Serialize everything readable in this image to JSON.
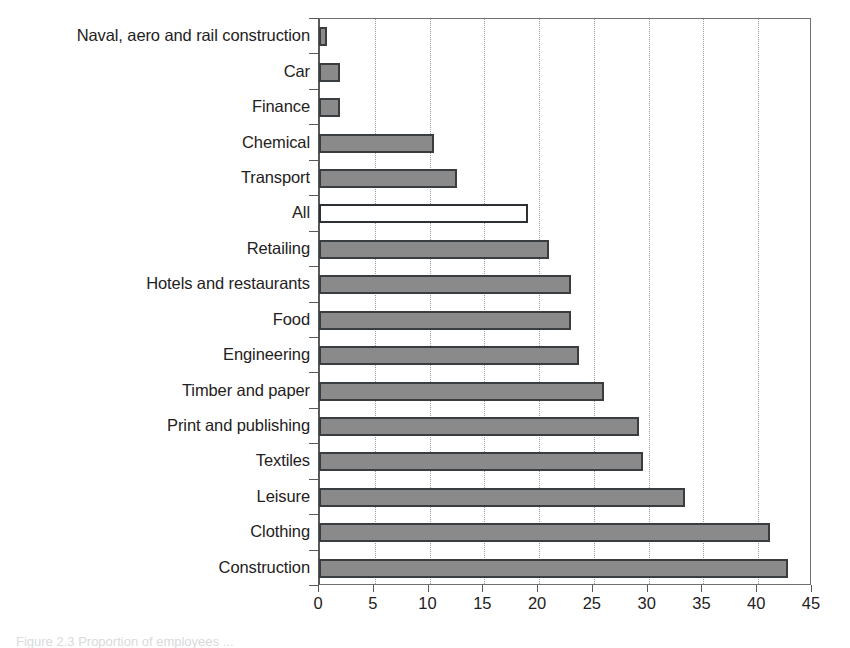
{
  "chart_data": {
    "type": "bar",
    "orientation": "horizontal",
    "title": "",
    "xlabel": "",
    "ylabel": "",
    "xlim": [
      0,
      45
    ],
    "xticks": [
      0,
      5,
      10,
      15,
      20,
      25,
      30,
      35,
      40,
      45
    ],
    "grid": "vertical-dotted",
    "legend": "none",
    "categories": [
      "Naval, aero and rail construction",
      "Car",
      "Finance",
      "Chemical",
      "Transport",
      "All",
      "Retailing",
      "Hotels and restaurants",
      "Food",
      "Engineering",
      "Timber and paper",
      "Print and publishing",
      "Textiles",
      "Leisure",
      "Clothing",
      "Construction"
    ],
    "values": [
      0.7,
      1.9,
      1.9,
      10.5,
      12.6,
      19.1,
      21.0,
      23.0,
      23.0,
      23.7,
      26.0,
      29.2,
      29.6,
      33.4,
      41.2,
      42.8
    ],
    "highlight_category": "All",
    "colors": {
      "bar_fill": "#8a8a8a",
      "bar_edge": "#3a3d3f",
      "highlight_fill": "#ffffff",
      "highlight_edge": "#2e3133",
      "gridline": "#9a9a9a",
      "axis": "#55595c",
      "text": "#1f2122"
    }
  },
  "caption": {
    "text": "Figure 2.3  Proportion of employees ..."
  }
}
